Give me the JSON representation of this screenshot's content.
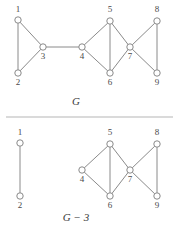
{
  "figure": {
    "background_color": "#ffffff",
    "edge_color": "#8a8a8a",
    "node_fill": "#ffffff",
    "node_stroke": "#8a8a8a",
    "label_color": "#4a4a4a",
    "rule_color": "#b5b5b5",
    "separator_rule": {
      "x1": 6,
      "y1": 117,
      "x2": 173,
      "y2": 117
    }
  },
  "graphs": [
    {
      "id": "graph-G",
      "caption": "G",
      "caption_position": {
        "x": 76,
        "y": 105
      },
      "node_radius": 3.2,
      "nodes": [
        {
          "id": "1",
          "label": "1",
          "x": 18,
          "y": 20,
          "label_x": 18,
          "label_y": 12
        },
        {
          "id": "2",
          "label": "2",
          "x": 18,
          "y": 73,
          "label_x": 18,
          "label_y": 85
        },
        {
          "id": "3",
          "label": "3",
          "x": 43,
          "y": 47,
          "label_x": 43,
          "label_y": 59
        },
        {
          "id": "4",
          "label": "4",
          "x": 82,
          "y": 47,
          "label_x": 82,
          "label_y": 59
        },
        {
          "id": "5",
          "label": "5",
          "x": 110,
          "y": 21,
          "label_x": 110,
          "label_y": 12
        },
        {
          "id": "6",
          "label": "6",
          "x": 110,
          "y": 73,
          "label_x": 110,
          "label_y": 85
        },
        {
          "id": "7",
          "label": "7",
          "x": 130,
          "y": 47,
          "label_x": 130,
          "label_y": 59
        },
        {
          "id": "8",
          "label": "8",
          "x": 157,
          "y": 21,
          "label_x": 157,
          "label_y": 12
        },
        {
          "id": "9",
          "label": "9",
          "x": 157,
          "y": 73,
          "label_x": 157,
          "label_y": 85
        }
      ],
      "edges": [
        [
          "1",
          "2"
        ],
        [
          "1",
          "3"
        ],
        [
          "2",
          "3"
        ],
        [
          "3",
          "4"
        ],
        [
          "4",
          "5"
        ],
        [
          "4",
          "6"
        ],
        [
          "5",
          "6"
        ],
        [
          "5",
          "7"
        ],
        [
          "6",
          "7"
        ],
        [
          "7",
          "8"
        ],
        [
          "7",
          "9"
        ],
        [
          "8",
          "9"
        ]
      ]
    },
    {
      "id": "graph-G-minus-3",
      "caption": "G − 3",
      "caption_position": {
        "x": 76,
        "y": 221
      },
      "node_radius": 3.2,
      "nodes": [
        {
          "id": "1",
          "label": "1",
          "x": 20,
          "y": 143,
          "label_x": 20,
          "label_y": 135
        },
        {
          "id": "2",
          "label": "2",
          "x": 20,
          "y": 196,
          "label_x": 20,
          "label_y": 208
        },
        {
          "id": "4",
          "label": "4",
          "x": 82,
          "y": 170,
          "label_x": 82,
          "label_y": 182
        },
        {
          "id": "5",
          "label": "5",
          "x": 110,
          "y": 144,
          "label_x": 110,
          "label_y": 135
        },
        {
          "id": "6",
          "label": "6",
          "x": 110,
          "y": 196,
          "label_x": 110,
          "label_y": 208
        },
        {
          "id": "7",
          "label": "7",
          "x": 130,
          "y": 170,
          "label_x": 130,
          "label_y": 182
        },
        {
          "id": "8",
          "label": "8",
          "x": 157,
          "y": 144,
          "label_x": 157,
          "label_y": 135
        },
        {
          "id": "9",
          "label": "9",
          "x": 157,
          "y": 196,
          "label_x": 157,
          "label_y": 208
        }
      ],
      "edges": [
        [
          "1",
          "2"
        ],
        [
          "4",
          "5"
        ],
        [
          "4",
          "6"
        ],
        [
          "5",
          "6"
        ],
        [
          "5",
          "7"
        ],
        [
          "6",
          "7"
        ],
        [
          "7",
          "8"
        ],
        [
          "7",
          "9"
        ],
        [
          "8",
          "9"
        ]
      ]
    }
  ]
}
